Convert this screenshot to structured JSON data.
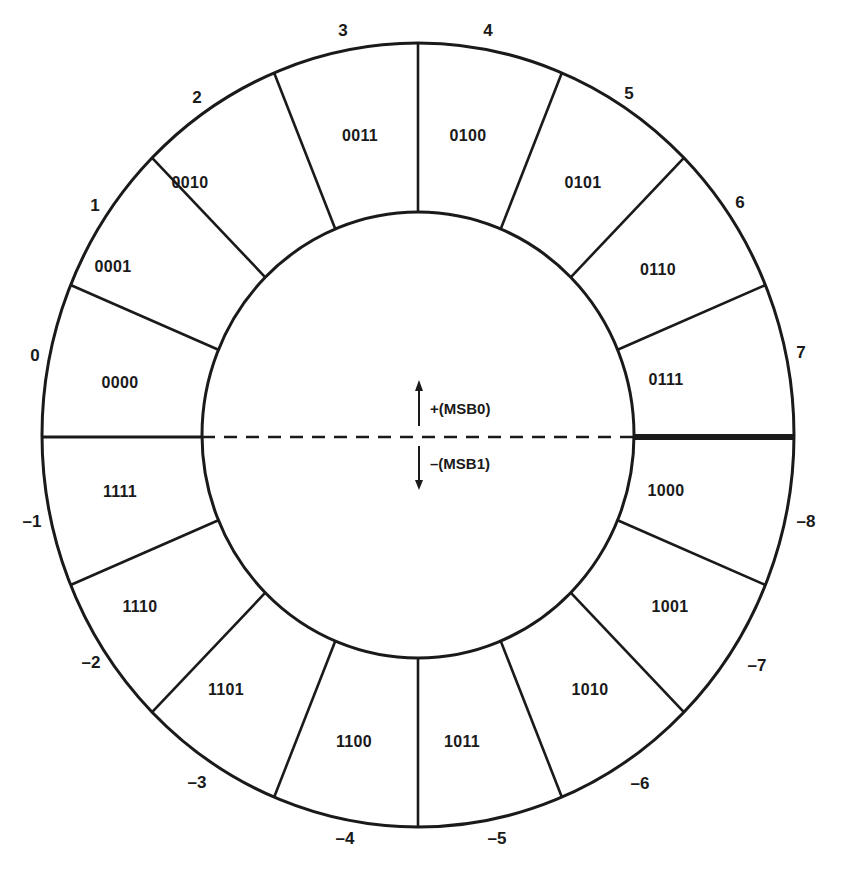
{
  "diagram": {
    "stroke_color": "#1a1a1a",
    "outer_ellipse": {
      "cx": 418,
      "cy": 435,
      "rx": 376,
      "ry": 392
    },
    "inner_ellipse": {
      "cx": 418,
      "cy": 435,
      "rx": 216,
      "ry": 223
    },
    "divider_y": 437,
    "positive_label": "+(MSB0)",
    "negative_label": "–(MSB1)",
    "arrow_x": 419,
    "positive_label_pos": {
      "x": 430,
      "y": 408
    },
    "negative_label_pos": {
      "x": 430,
      "y": 463
    }
  },
  "segments": [
    {
      "value": "0",
      "code": "0000",
      "value_pos": [
        35,
        355
      ],
      "code_pos": [
        120,
        383
      ]
    },
    {
      "value": "1",
      "code": "0001",
      "value_pos": [
        95,
        205
      ],
      "code_pos": [
        113,
        267
      ]
    },
    {
      "value": "2",
      "code": "0010",
      "value_pos": [
        197,
        97
      ],
      "code_pos": [
        190,
        183
      ]
    },
    {
      "value": "3",
      "code": "0011",
      "value_pos": [
        343,
        30
      ],
      "code_pos": [
        360,
        136
      ]
    },
    {
      "value": "4",
      "code": "0100",
      "value_pos": [
        488,
        30
      ],
      "code_pos": [
        468,
        136
      ]
    },
    {
      "value": "5",
      "code": "0101",
      "value_pos": [
        629,
        93
      ],
      "code_pos": [
        583,
        183
      ]
    },
    {
      "value": "6",
      "code": "0110",
      "value_pos": [
        740,
        202
      ],
      "code_pos": [
        658,
        270
      ]
    },
    {
      "value": "7",
      "code": "0111",
      "value_pos": [
        801,
        352
      ],
      "code_pos": [
        666,
        380
      ]
    },
    {
      "value": "–8",
      "code": "1000",
      "value_pos": [
        806,
        521
      ],
      "code_pos": [
        666,
        491
      ]
    },
    {
      "value": "–7",
      "code": "1001",
      "value_pos": [
        757,
        665
      ],
      "code_pos": [
        670,
        607
      ]
    },
    {
      "value": "–6",
      "code": "1010",
      "value_pos": [
        640,
        783
      ],
      "code_pos": [
        590,
        690
      ]
    },
    {
      "value": "–5",
      "code": "1011",
      "value_pos": [
        497,
        838
      ],
      "code_pos": [
        462,
        742
      ]
    },
    {
      "value": "–4",
      "code": "1100",
      "value_pos": [
        345,
        838
      ],
      "code_pos": [
        354,
        742
      ]
    },
    {
      "value": "–3",
      "code": "1101",
      "value_pos": [
        197,
        782
      ],
      "code_pos": [
        226,
        690
      ]
    },
    {
      "value": "–2",
      "code": "1110",
      "value_pos": [
        91,
        662
      ],
      "code_pos": [
        140,
        607
      ]
    },
    {
      "value": "–1",
      "code": "1111",
      "value_pos": [
        32,
        521
      ],
      "code_pos": [
        120,
        492
      ]
    }
  ]
}
